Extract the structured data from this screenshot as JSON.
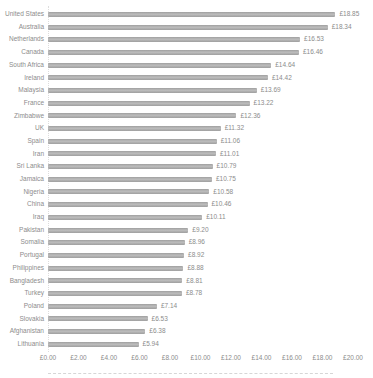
{
  "chart_data": {
    "type": "bar",
    "orientation": "horizontal",
    "title": "",
    "xlabel": "",
    "ylabel": "",
    "currency_symbol": "£",
    "xlim": [
      0,
      20
    ],
    "grid": false,
    "bar_color": "#a8a8a8",
    "text_color": "#8c8c8c",
    "categories": [
      "United States",
      "Australia",
      "Netherlands",
      "Canada",
      "South Africa",
      "Ireland",
      "Malaysia",
      "France",
      "Zimbabwe",
      "UK",
      "Spain",
      "Iran",
      "Sri Lanka",
      "Jamaica",
      "Nigeria",
      "China",
      "Iraq",
      "Pakistan",
      "Somalia",
      "Portugal",
      "Philippines",
      "Bangladesh",
      "Turkey",
      "Poland",
      "Slovakia",
      "Afghanistan",
      "Lithuania"
    ],
    "values": [
      18.85,
      18.34,
      16.53,
      16.46,
      14.64,
      14.42,
      13.69,
      13.22,
      12.36,
      11.32,
      11.06,
      11.01,
      10.79,
      10.75,
      10.58,
      10.46,
      10.11,
      9.2,
      8.96,
      8.92,
      8.88,
      8.81,
      8.78,
      7.14,
      6.53,
      6.38,
      5.94
    ],
    "value_labels": [
      "£18.85",
      "£18.34",
      "£16.53",
      "£16.46",
      "£14.64",
      "£14.42",
      "£13.69",
      "£13.22",
      "£12.36",
      "£11.32",
      "£11.06",
      "£11.01",
      "£10.79",
      "£10.75",
      "£10.58",
      "£10.46",
      "£10.11",
      "£9.20",
      "£8.96",
      "£8.92",
      "£8.88",
      "£8.81",
      "£8.78",
      "£7.14",
      "£6.53",
      "£6.38",
      "£5.94"
    ],
    "x_axis_ticks": [
      "£0.00",
      "£2.00",
      "£4.00",
      "£6.00",
      "£8.00",
      "£10.00",
      "£12.00",
      "£14.00",
      "£16.00",
      "£18.00",
      "£20.00"
    ],
    "x_axis_tick_values": [
      0,
      2,
      4,
      6,
      8,
      10,
      12,
      14,
      16,
      18,
      20
    ],
    "legend": null
  }
}
